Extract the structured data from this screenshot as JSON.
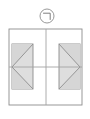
{
  "canvas": {
    "width": 90,
    "height": 119,
    "background_color": "#ffffff"
  },
  "style": {
    "stroke_color": "#8d8d8d",
    "centerline_color": "#a3a3a3",
    "fill_color": "#d6d6d6",
    "fill_color_light": "#dedede",
    "detail_circle_stroke": "#8d8d8d",
    "stroke_width": 0.9
  },
  "detail_callout": {
    "name": "detail-callout-bubble",
    "label": "⌐",
    "center_x": 47,
    "center_y": 16,
    "radius": 7
  },
  "outer_frame": {
    "name": "outer-rectangle",
    "x": 9,
    "y": 29,
    "width": 73,
    "height": 76
  },
  "centerlines": {
    "vertical": {
      "name": "vertical-centerline",
      "x": 46,
      "y1": 29,
      "y2": 105
    },
    "horizontal": {
      "name": "horizontal-centerline",
      "x1": 9,
      "x2": 82,
      "y": 67
    }
  },
  "left_feature": {
    "name": "left-bowtie-feature",
    "x": 12,
    "y": 44,
    "width": 21,
    "height": 45,
    "orientation": "left",
    "triangles": [
      {
        "name": "left-upper-triangle",
        "points": "12,44 33,44 12,67"
      },
      {
        "name": "left-lower-triangle",
        "points": "12,67 33,89 12,89"
      }
    ]
  },
  "right_feature": {
    "name": "right-bowtie-feature",
    "x": 59,
    "y": 44,
    "width": 21,
    "height": 45,
    "orientation": "right",
    "triangles": [
      {
        "name": "right-upper-triangle",
        "points": "59,44 80,44 80,67"
      },
      {
        "name": "right-lower-triangle",
        "points": "80,67 80,89 59,89"
      }
    ]
  },
  "figure": {
    "type": "technical-drawing"
  }
}
